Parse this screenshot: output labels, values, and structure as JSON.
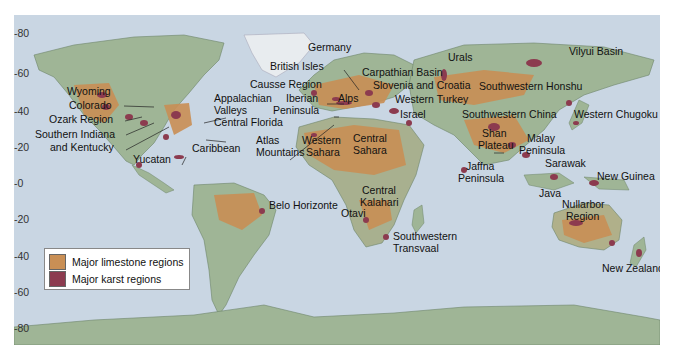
{
  "map": {
    "title": "World limestone and karst regions",
    "colors": {
      "ocean": "#c9d6e3",
      "land": "#9fb596",
      "land_dark": "#7f9a7a",
      "ice": "#e8ecef",
      "limestone": "#c98f55",
      "karst": "#8c3b4f"
    },
    "latitude_ticks": [
      {
        "label": "80",
        "y": 34
      },
      {
        "label": "60",
        "y": 74
      },
      {
        "label": "40",
        "y": 112
      },
      {
        "label": "20",
        "y": 148
      },
      {
        "label": "0",
        "y": 184
      },
      {
        "label": "20",
        "y": 220
      },
      {
        "label": "40",
        "y": 257
      },
      {
        "label": "60",
        "y": 293
      },
      {
        "label": "80",
        "y": 329
      }
    ],
    "labels": [
      {
        "text": "Wyoming",
        "x": 67,
        "y": 91
      },
      {
        "text": "Colorado",
        "x": 69,
        "y": 105
      },
      {
        "text": "Ozark Region",
        "x": 49,
        "y": 119
      },
      {
        "text": "Southern Indiana",
        "x": 35,
        "y": 134
      },
      {
        "text": "and Kentucky",
        "x": 50,
        "y": 147
      },
      {
        "text": "Yucatan",
        "x": 133,
        "y": 159
      },
      {
        "text": "Appalachian",
        "x": 214,
        "y": 98
      },
      {
        "text": "Valleys",
        "x": 214,
        "y": 110
      },
      {
        "text": "Central Florida",
        "x": 214,
        "y": 122
      },
      {
        "text": "Caribbean",
        "x": 192,
        "y": 148
      },
      {
        "text": "Germany",
        "x": 308,
        "y": 47
      },
      {
        "text": "British Isles",
        "x": 270,
        "y": 66
      },
      {
        "text": "Causse Region",
        "x": 250,
        "y": 84
      },
      {
        "text": "Iberian",
        "x": 286,
        "y": 98
      },
      {
        "text": "Peninsula",
        "x": 273,
        "y": 110
      },
      {
        "text": "Alps",
        "x": 338,
        "y": 98
      },
      {
        "text": "Carpathian Basin",
        "x": 362,
        "y": 72
      },
      {
        "text": "Slovenia and Croatia",
        "x": 373,
        "y": 85
      },
      {
        "text": "Western Turkey",
        "x": 395,
        "y": 99
      },
      {
        "text": "Israel",
        "x": 400,
        "y": 114
      },
      {
        "text": "Atlas",
        "x": 256,
        "y": 140
      },
      {
        "text": "Mountains",
        "x": 256,
        "y": 152
      },
      {
        "text": "Western",
        "x": 302,
        "y": 140
      },
      {
        "text": "Sahara",
        "x": 306,
        "y": 152
      },
      {
        "text": "Central",
        "x": 353,
        "y": 138
      },
      {
        "text": "Sahara",
        "x": 353,
        "y": 150
      },
      {
        "text": "Urals",
        "x": 448,
        "y": 57
      },
      {
        "text": "Southwestern Honshu",
        "x": 479,
        "y": 86
      },
      {
        "text": "Vilyui Basin",
        "x": 569,
        "y": 51
      },
      {
        "text": "Southwestern China",
        "x": 462,
        "y": 114
      },
      {
        "text": "Western Chugoku",
        "x": 574,
        "y": 114
      },
      {
        "text": "Shan",
        "x": 482,
        "y": 133
      },
      {
        "text": "Plateau",
        "x": 478,
        "y": 145
      },
      {
        "text": "Malay",
        "x": 527,
        "y": 138
      },
      {
        "text": "Peninsula",
        "x": 519,
        "y": 150
      },
      {
        "text": "Sarawak",
        "x": 545,
        "y": 163
      },
      {
        "text": "Jaffna",
        "x": 466,
        "y": 166
      },
      {
        "text": "Peninsula",
        "x": 458,
        "y": 178
      },
      {
        "text": "New Guinea",
        "x": 597,
        "y": 176
      },
      {
        "text": "Java",
        "x": 539,
        "y": 193
      },
      {
        "text": "Nullarbor",
        "x": 562,
        "y": 204
      },
      {
        "text": "Region",
        "x": 566,
        "y": 216
      },
      {
        "text": "Central",
        "x": 362,
        "y": 190
      },
      {
        "text": "Kalahari",
        "x": 360,
        "y": 202
      },
      {
        "text": "Otavi",
        "x": 341,
        "y": 213
      },
      {
        "text": "Southwestern",
        "x": 393,
        "y": 236
      },
      {
        "text": "Transvaal",
        "x": 393,
        "y": 248
      },
      {
        "text": "Belo Horizonte",
        "x": 269,
        "y": 205
      },
      {
        "text": "New Zealand",
        "x": 602,
        "y": 268
      }
    ]
  },
  "legend": {
    "items": [
      {
        "label": "Major limestone regions",
        "color": "#c98f55"
      },
      {
        "label": "Major karst regions",
        "color": "#8c3b4f"
      }
    ]
  }
}
